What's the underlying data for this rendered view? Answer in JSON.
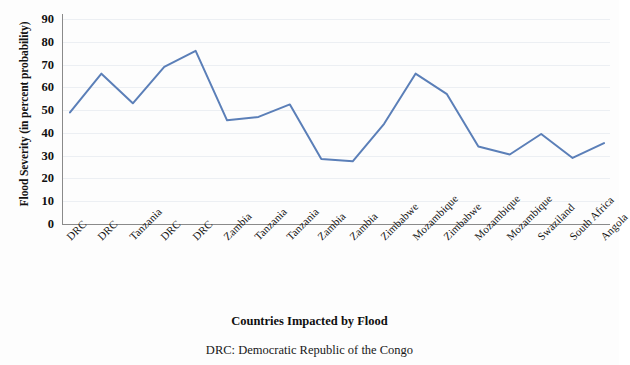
{
  "chart_data": {
    "type": "line",
    "title": "",
    "xlabel": "Countries Impacted by Flood",
    "ylabel": "Flood Severity (in percent probability)",
    "caption": "DRC: Democratic Republic of the Congo",
    "ylim": [
      0,
      90
    ],
    "ytick_labels": [
      "90",
      "80",
      "70",
      "60",
      "50",
      "40",
      "30",
      "20",
      "10",
      "0"
    ],
    "yticks": [
      90,
      80,
      70,
      60,
      50,
      40,
      30,
      20,
      10,
      0
    ],
    "grid": true,
    "legend": "none",
    "line_color": "#5B7FB8",
    "categories": [
      "DRC",
      "DRC",
      "Tanzania",
      "DRC",
      "DRC",
      "Zambia",
      "Tanzania",
      "Tanzania",
      "Zambia",
      "Zambia",
      "Zimbabwe",
      "Mozambique",
      "Zimbabwe",
      "Mozambique",
      "Mozambique",
      "Swaziland",
      "South Africa",
      "Angola"
    ],
    "values": [
      49,
      66,
      53,
      69,
      76,
      45.5,
      47,
      52.5,
      28.5,
      27.5,
      44,
      66,
      57,
      34,
      30.5,
      39.5,
      29,
      35.5
    ]
  }
}
